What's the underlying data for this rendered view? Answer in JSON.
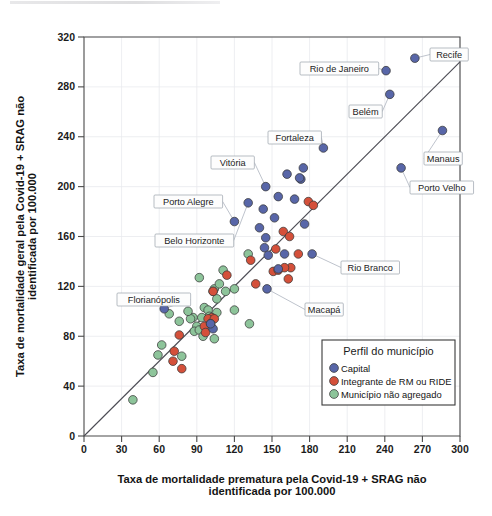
{
  "chart_data": {
    "type": "scatter",
    "title": "",
    "xlabel": "Taxa de mortalidade prematura pela Covid-19 + SRAG não identificada por 100.000",
    "xlabel_line1": "Taxa de mortalidade prematura pela Covid-19 + SRAG não",
    "xlabel_line2": "identificada por 100.000",
    "ylabel": "Taxa de mortalidade geral pela Covid-19 + SRAG não identificada por 100.000",
    "ylabel_line1": "Taxa de mortalidade geral pela Covid-19 + SRAG não",
    "ylabel_line2": "identificada por 100.000",
    "xlim": [
      0,
      300
    ],
    "ylim": [
      0,
      320
    ],
    "xticks": [
      0,
      30,
      60,
      90,
      120,
      150,
      180,
      210,
      240,
      270,
      300
    ],
    "yticks": [
      0,
      40,
      80,
      120,
      160,
      200,
      240,
      280,
      320
    ],
    "grid": true,
    "reference_line": {
      "type": "identity",
      "from": [
        0,
        0
      ],
      "to": [
        300,
        300
      ],
      "label": "y = x"
    },
    "legend": {
      "position": "bottom-right",
      "title": "Perfil do município",
      "entries": [
        {
          "label": "Capital",
          "color": "#5866a8"
        },
        {
          "label": "Integrante de RM ou RIDE",
          "color": "#d4503a"
        },
        {
          "label": "Município não agregado",
          "color": "#8dc49a"
        }
      ]
    },
    "series": [
      {
        "name": "Capital",
        "color": "#5866a8",
        "points": [
          [
            264,
            303
          ],
          [
            241,
            293
          ],
          [
            244,
            274
          ],
          [
            286,
            245
          ],
          [
            191,
            231
          ],
          [
            253,
            215
          ],
          [
            175,
            215
          ],
          [
            162,
            210
          ],
          [
            173,
            206
          ],
          [
            172,
            207
          ],
          [
            145,
            200
          ],
          [
            155,
            192
          ],
          [
            168,
            190
          ],
          [
            131,
            187
          ],
          [
            143,
            182
          ],
          [
            176,
            170
          ],
          [
            152,
            175
          ],
          [
            140,
            167
          ],
          [
            145,
            159
          ],
          [
            144,
            151
          ],
          [
            147,
            145
          ],
          [
            182,
            146
          ],
          [
            120,
            172
          ],
          [
            155,
            134
          ],
          [
            146,
            118
          ],
          [
            64,
            102
          ],
          [
            103,
            86
          ],
          [
            160,
            146
          ],
          [
            101,
            90
          ]
        ]
      },
      {
        "name": "Integrante de RM ou RIDE",
        "color": "#d4503a",
        "points": [
          [
            179,
            188
          ],
          [
            183,
            185
          ],
          [
            159,
            164
          ],
          [
            164,
            160
          ],
          [
            153,
            150
          ],
          [
            171,
            146
          ],
          [
            151,
            132
          ],
          [
            163,
            126
          ],
          [
            165,
            135
          ],
          [
            137,
            122
          ],
          [
            133,
            141
          ],
          [
            114,
            129
          ],
          [
            103,
            116
          ],
          [
            102,
            95
          ],
          [
            99,
            94
          ],
          [
            96,
            88
          ],
          [
            97,
            83
          ],
          [
            76,
            81
          ],
          [
            72,
            68
          ],
          [
            71,
            60
          ],
          [
            78,
            54
          ],
          [
            104,
            94
          ],
          [
            101,
            90
          ],
          [
            155,
            133
          ],
          [
            160,
            135
          ]
        ]
      },
      {
        "name": "Município não agregado",
        "color": "#8dc49a",
        "points": [
          [
            131,
            146
          ],
          [
            111,
            133
          ],
          [
            92,
            127
          ],
          [
            104,
            118
          ],
          [
            103,
            116
          ],
          [
            106,
            110
          ],
          [
            120,
            101
          ],
          [
            132,
            90
          ],
          [
            96,
            103
          ],
          [
            99,
            101
          ],
          [
            101,
            94
          ],
          [
            100,
            96
          ],
          [
            94,
            95
          ],
          [
            87,
            95
          ],
          [
            85,
            94
          ],
          [
            83,
            100
          ],
          [
            76,
            92
          ],
          [
            104,
            78
          ],
          [
            101,
            88
          ],
          [
            90,
            88
          ],
          [
            88,
            84
          ],
          [
            62,
            73
          ],
          [
            59,
            65
          ],
          [
            55,
            51
          ],
          [
            39,
            29
          ],
          [
            78,
            64
          ],
          [
            68,
            98
          ],
          [
            113,
            116
          ],
          [
            106,
            99
          ],
          [
            108,
            122
          ],
          [
            120,
            118
          ],
          [
            92,
            85
          ],
          [
            95,
            80
          ]
        ]
      }
    ],
    "annotations": [
      {
        "label": "Recife",
        "point": [
          264,
          303
        ],
        "box": [
          430,
          48
        ]
      },
      {
        "label": "Rio de Janeiro",
        "point": [
          241,
          293
        ],
        "box": [
          300,
          62
        ]
      },
      {
        "label": "Belém",
        "point": [
          244,
          274
        ],
        "box": [
          349,
          105
        ]
      },
      {
        "label": "Manaus",
        "point": [
          286,
          245
        ],
        "box": [
          424,
          152
        ]
      },
      {
        "label": "Porto Velho",
        "point": [
          253,
          215
        ],
        "box": [
          410,
          181
        ]
      },
      {
        "label": "Fortaleza",
        "point": [
          191,
          231
        ],
        "box": [
          268,
          131
        ]
      },
      {
        "label": "Vitória",
        "point": [
          145,
          200
        ],
        "box": [
          211,
          156
        ]
      },
      {
        "label": "Porto Alegre",
        "point": [
          120,
          172
        ],
        "box": [
          154,
          195
        ]
      },
      {
        "label": "Belo Horizonte",
        "point": [
          131,
          187
        ],
        "box": [
          155,
          234
        ]
      },
      {
        "label": "Rio Branco",
        "point": [
          182,
          146
        ],
        "box": [
          341,
          261
        ]
      },
      {
        "label": "Macapá",
        "point": [
          146,
          118
        ],
        "box": [
          305,
          303
        ]
      },
      {
        "label": "Florianópolis",
        "point": [
          64,
          102
        ],
        "box": [
          117,
          293
        ]
      }
    ]
  }
}
